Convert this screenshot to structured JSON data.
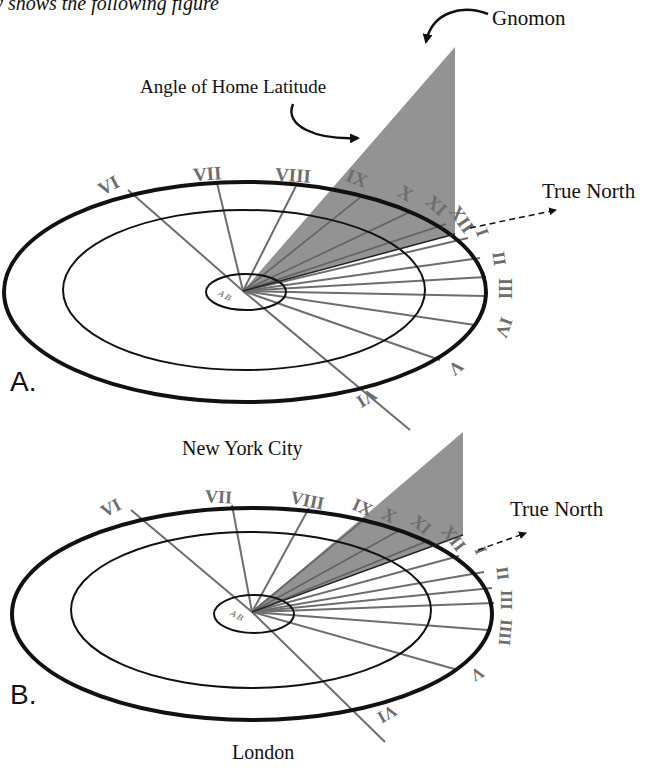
{
  "top_caption_fragment": "y shows the following figure",
  "labels": {
    "gnomon": "Gnomon",
    "angle_of_home_latitude": "Angle of Home Latitude",
    "true_north": "True North",
    "ab_marker": "A B"
  },
  "panels": [
    {
      "letter": "A.",
      "city": "New York City",
      "numerals": [
        "VI",
        "VII",
        "VIII",
        "IX",
        "X",
        "XI",
        "XII",
        "I",
        "II",
        "III",
        "IV",
        "V",
        "VI"
      ]
    },
    {
      "letter": "B.",
      "city": "London",
      "numerals": [
        "VI",
        "VII",
        "VIII",
        "IX",
        "X",
        "XI",
        "XII",
        "I",
        "II",
        "III",
        "IIII",
        "V",
        "VI"
      ]
    }
  ],
  "colors": {
    "gnomon_fill": "#8a8a8a",
    "hour_line": "#6e6e6e",
    "ring_stroke": "#111111",
    "background": "#ffffff"
  }
}
